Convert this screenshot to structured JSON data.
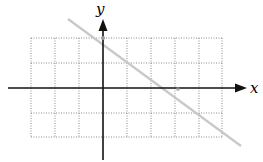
{
  "diagram": {
    "type": "coordinate-plane-line",
    "axes": {
      "x_label": "x",
      "y_label": "y"
    },
    "grid": {
      "columns": 8,
      "rows": 4,
      "x_range": [
        -3,
        5
      ],
      "y_range": [
        -2,
        2
      ],
      "style": "dotted"
    },
    "line": {
      "through": [
        [
          0,
          2
        ],
        [
          3,
          0
        ]
      ],
      "slope": -0.6667,
      "y_intercept": 2,
      "x_intercept": 3,
      "color": "#c8c8c8"
    },
    "points": [
      {
        "x": 0,
        "y": 2
      },
      {
        "x": 3,
        "y": 0
      }
    ],
    "colors": {
      "axis": "#111111",
      "grid": "#8a8a8a",
      "line": "#c8c8c8",
      "point": "#9a9a9a"
    }
  }
}
